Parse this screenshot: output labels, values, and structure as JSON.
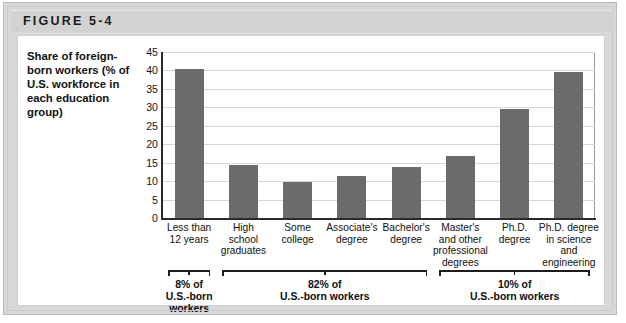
{
  "figure": {
    "header_label": "FIGURE 5-4",
    "caption": "Share of foreign-born workers (% of U.S. workforce in each education group)"
  },
  "colors": {
    "bar": "#6b6b6b",
    "frame": "#d8d8d8",
    "header_band": "#d2d2d2",
    "card": "#ffffff",
    "gridline": "#d6d6d6",
    "axis": "#2a2a2a"
  },
  "chart_data": {
    "type": "bar",
    "title": "",
    "xlabel": "",
    "ylabel": "Share of foreign-born workers (% of U.S. workforce in each education group)",
    "ylim": [
      0,
      45
    ],
    "yticks": [
      0,
      5,
      10,
      15,
      20,
      25,
      30,
      35,
      40,
      45
    ],
    "grid": true,
    "legend": "none",
    "categories": [
      "Less than 12 years",
      "High school graduates",
      "Some college",
      "Associate's degree",
      "Bachelor's degree",
      "Master's and other professional degrees",
      "Ph.D. degree",
      "Ph.D. degree in science and engineering"
    ],
    "category_lines": [
      [
        "Less than",
        "12 years"
      ],
      [
        "High",
        "school",
        "graduates"
      ],
      [
        "Some",
        "college"
      ],
      [
        "Associate's",
        "degree"
      ],
      [
        "Bachelor's",
        "degree"
      ],
      [
        "Master's",
        "and other",
        "professional",
        "degrees"
      ],
      [
        "Ph.D.",
        "degree"
      ],
      [
        "Ph.D. degree",
        "in science",
        "and",
        "engineering"
      ]
    ],
    "values": [
      40.5,
      14.3,
      9.8,
      11.3,
      13.8,
      16.7,
      29.5,
      39.5
    ],
    "annotations": [
      {
        "label_lines": [
          "8% of",
          "U.S.-born workers"
        ],
        "covers": [
          0,
          0
        ]
      },
      {
        "label_lines": [
          "82% of",
          "U.S.-born workers"
        ],
        "covers": [
          1,
          4
        ]
      },
      {
        "label_lines": [
          "10% of",
          "U.S.-born workers"
        ],
        "covers": [
          5,
          7
        ]
      }
    ]
  }
}
